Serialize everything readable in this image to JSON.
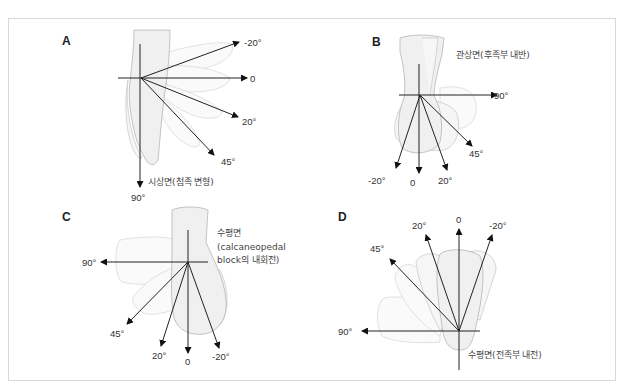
{
  "figure": {
    "panels": [
      {
        "id": "A",
        "letter": "A",
        "plane_caption": "시상면(첨족 변형)",
        "angles": [
          {
            "label": "-20°",
            "value": -20
          },
          {
            "label": "0",
            "value": 0
          },
          {
            "label": "20°",
            "value": 20
          },
          {
            "label": "45°",
            "value": 45
          },
          {
            "label": "90°",
            "value": 90
          }
        ]
      },
      {
        "id": "B",
        "letter": "B",
        "plane_caption": "관상면(후족부 내반)",
        "angles": [
          {
            "label": "90°",
            "value": 90
          },
          {
            "label": "45°",
            "value": 45
          },
          {
            "label": "20°",
            "value": 20
          },
          {
            "label": "0",
            "value": 0
          },
          {
            "label": "-20°",
            "value": -20
          }
        ]
      },
      {
        "id": "C",
        "letter": "C",
        "plane_caption_lines": [
          "수평면",
          "(calcaneopedal",
          "block의 내회전)"
        ],
        "angles": [
          {
            "label": "90°",
            "value": 90
          },
          {
            "label": "45°",
            "value": 45
          },
          {
            "label": "20°",
            "value": 20
          },
          {
            "label": "0",
            "value": 0
          },
          {
            "label": "-20°",
            "value": -20
          }
        ]
      },
      {
        "id": "D",
        "letter": "D",
        "plane_caption": "수평면(전족부 내전)",
        "angles": [
          {
            "label": "0",
            "value": 0
          },
          {
            "label": "20°",
            "value": 20
          },
          {
            "label": "-20°",
            "value": -20
          },
          {
            "label": "45°",
            "value": 45
          },
          {
            "label": "90°",
            "value": 90
          }
        ]
      }
    ]
  }
}
